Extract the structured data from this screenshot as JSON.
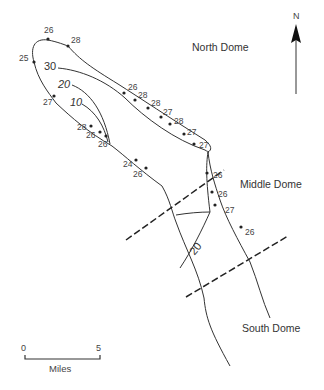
{
  "map": {
    "north_label": "N",
    "domes": {
      "north": "North Dome",
      "middle": "Middle Dome",
      "south": "South Dome"
    },
    "contours": [
      {
        "value": "30",
        "x": 38,
        "y": 68
      },
      {
        "value": "20",
        "x": 55,
        "y": 87,
        "rotate": 0
      },
      {
        "value": "10",
        "x": 68,
        "y": 106
      },
      {
        "value": "20",
        "x": 190,
        "y": 248,
        "rotate": -50
      }
    ],
    "point_labels": [
      {
        "value": "26",
        "x": 44,
        "y": 32
      },
      {
        "value": "28",
        "x": 70,
        "y": 40
      },
      {
        "value": "25",
        "x": 18,
        "y": 61
      },
      {
        "value": "27",
        "x": 43,
        "y": 104
      },
      {
        "value": "28",
        "x": 75,
        "y": 130
      },
      {
        "value": "26",
        "x": 86,
        "y": 138
      },
      {
        "value": "26",
        "x": 98,
        "y": 146
      },
      {
        "value": "24",
        "x": 124,
        "y": 166
      },
      {
        "value": "26",
        "x": 135,
        "y": 176
      },
      {
        "value": "26",
        "x": 131,
        "y": 89
      },
      {
        "value": "28",
        "x": 138,
        "y": 98
      },
      {
        "value": "28",
        "x": 150,
        "y": 106
      },
      {
        "value": "27",
        "x": 163,
        "y": 115
      },
      {
        "value": "28",
        "x": 173,
        "y": 124
      },
      {
        "value": "27",
        "x": 186,
        "y": 134
      },
      {
        "value": "27",
        "x": 197,
        "y": 146
      },
      {
        "value": "26",
        "x": 213,
        "y": 177
      },
      {
        "value": "26",
        "x": 218,
        "y": 197
      },
      {
        "value": "27",
        "x": 222,
        "y": 212
      },
      {
        "value": "26",
        "x": 243,
        "y": 234
      }
    ],
    "scale": {
      "start": "0",
      "end": "5",
      "unit": "Miles"
    }
  }
}
